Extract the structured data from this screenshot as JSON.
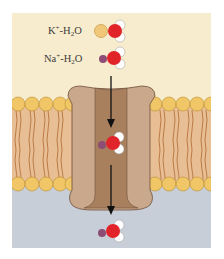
{
  "figure": {
    "labels": {
      "k_ion": {
        "ion": "K",
        "charge": "+",
        "sep": "-H",
        "sub": "2",
        "tail": "O"
      },
      "na_ion": {
        "ion": "Na",
        "charge": "+",
        "sep": "-H",
        "sub": "2",
        "tail": "O"
      }
    },
    "colors": {
      "extracellular": "#f8ecce",
      "intracellular": "#c8ced7",
      "lipid_head": "#f0c667",
      "lipid_head_outline": "#b88d2d",
      "lipid_tail": "#c98a4e",
      "membrane_fill": "#e8bf94",
      "channel_outer": "#c9a88b",
      "channel_pore": "#a9805e",
      "channel_outline": "#6e4f3a",
      "k_ion": "#f1c77a",
      "na_ion": "#8e4d74",
      "oxygen": "#e0242a",
      "hydrogen": "#ffffff",
      "arrow": "#111111"
    },
    "molecules": [
      {
        "name": "k-water-complex",
        "ion": "K+",
        "position": "extracellular-top"
      },
      {
        "name": "na-water-complex",
        "ion": "Na+",
        "position": "extracellular"
      },
      {
        "name": "na-water-complex-in-pore",
        "ion": "Na+",
        "position": "channel-pore"
      },
      {
        "name": "na-water-complex-intracellular",
        "ion": "Na+",
        "position": "intracellular"
      }
    ],
    "arrows": [
      {
        "name": "arrow-into-channel",
        "direction": "down"
      },
      {
        "name": "arrow-out-of-channel",
        "direction": "down"
      }
    ]
  }
}
